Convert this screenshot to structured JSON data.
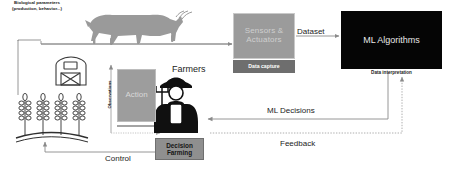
{
  "diagram": {
    "nodes": {
      "sensors": {
        "line1": "Sensors &",
        "line2": "Actuators"
      },
      "data_capture": "Data capture",
      "ml_algorithms": "ML Algorithms",
      "data_interpretation": "Data interpretation",
      "action": "Action",
      "decision": {
        "line1": "Decision",
        "line2": "Farming"
      }
    },
    "labels": {
      "dataset": "Dataset",
      "farmers": "Farmers",
      "ml_decisions": "ML Decisions",
      "feedback": "Feedback",
      "control": "Control",
      "observations": "Observations",
      "biological_line1": "Biological parameters",
      "biological_line2": "(production, behavior...)"
    },
    "icons": {
      "cow": "cow-icon",
      "signal": "signal-waves-icon",
      "barn": "barn-icon",
      "wheat": "wheat-stalks-icon",
      "farmer": "farmer-icon"
    },
    "colors": {
      "sensors_fill": "#9b9b9b",
      "data_capture_fill": "#6e6e6e",
      "ml_fill": "#050505",
      "action_fill": "#9d9d9d",
      "decision_fill": "#8f8f8f",
      "cow_fill": "#9a9a9a",
      "arrow": "#7d7d7d",
      "text": "#1b1b1b"
    }
  }
}
